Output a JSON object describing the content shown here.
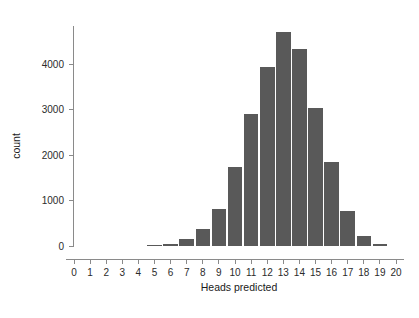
{
  "chart_data": {
    "type": "bar",
    "title": "",
    "subtitle": "",
    "xlabel": "Heads predicted",
    "ylabel": "count",
    "categories": [
      "0",
      "1",
      "2",
      "3",
      "4",
      "5",
      "6",
      "7",
      "8",
      "9",
      "10",
      "11",
      "12",
      "13",
      "14",
      "15",
      "16",
      "17",
      "18",
      "19",
      "20"
    ],
    "values": [
      0,
      0,
      0,
      0,
      0,
      5,
      45,
      160,
      380,
      810,
      1740,
      2910,
      3940,
      4700,
      4340,
      3030,
      1840,
      760,
      230,
      40,
      0
    ],
    "x_tick_labels": [
      "0",
      "1",
      "2",
      "3",
      "4",
      "5",
      "6",
      "7",
      "8",
      "9",
      "10",
      "11",
      "12",
      "13",
      "14",
      "15",
      "16",
      "17",
      "18",
      "19",
      "20"
    ],
    "y_tick_labels": [
      "0",
      "1000",
      "2000",
      "3000",
      "4000"
    ],
    "y_tick_values": [
      0,
      1000,
      2000,
      3000,
      4000
    ],
    "xlim": [
      -0.6,
      20.6
    ],
    "ylim": [
      0,
      4850
    ],
    "grid": false,
    "legend": null,
    "bar_color": "#595959",
    "axis_color": "#8a8a8a",
    "text_color": "#2b2b2b"
  }
}
